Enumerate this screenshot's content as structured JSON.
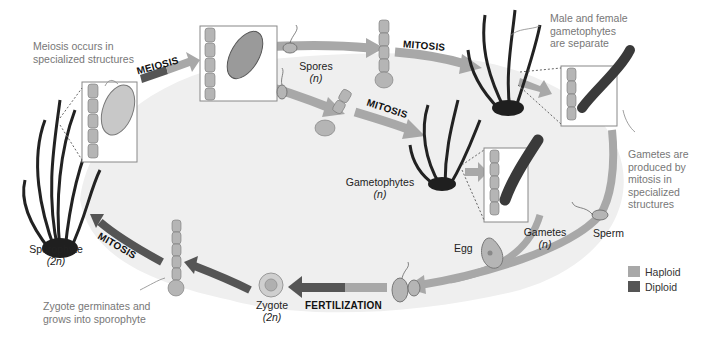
{
  "diagram": {
    "type": "life-cycle",
    "colors": {
      "haploid": "#a8a8a8",
      "diploid": "#555555",
      "cycle_fill": "#efefef",
      "plant_dark": "#1f1f1f",
      "cell_fill": "#b5b5b5",
      "box_border": "#888888"
    },
    "stages": {
      "sporophyte": {
        "name": "Sporophyte",
        "ploidy": "(2n)"
      },
      "spores": {
        "name": "Spores",
        "ploidy": "(n)"
      },
      "gametophytes": {
        "name": "Gametophytes",
        "ploidy": "(n)"
      },
      "gametes": {
        "name": "Gametes",
        "ploidy": "(n)"
      },
      "egg": {
        "name": "Egg"
      },
      "sperm": {
        "name": "Sperm"
      },
      "zygote": {
        "name": "Zygote",
        "ploidy": "(2n)"
      }
    },
    "processes": {
      "meiosis": "MEIOSIS",
      "mitosis_upper": "MITOSIS",
      "mitosis_middle": "MITOSIS",
      "fertilization": "FERTILIZATION",
      "mitosis_lower": "MITOSIS"
    },
    "notes": {
      "meiosis_note": [
        "Meiosis occurs in",
        "specialized structures"
      ],
      "gametophyte_note": [
        "Male and female",
        "gametophytes",
        "are separate"
      ],
      "gamete_note": [
        "Gametes are",
        "produced by",
        "mitosis in",
        "specialized",
        "structures"
      ],
      "zygote_note": [
        "Zygote germinates and",
        "grows into sporophyte"
      ]
    },
    "legend": [
      {
        "label": "Haploid",
        "color": "#a8a8a8"
      },
      {
        "label": "Diploid",
        "color": "#555555"
      }
    ]
  }
}
